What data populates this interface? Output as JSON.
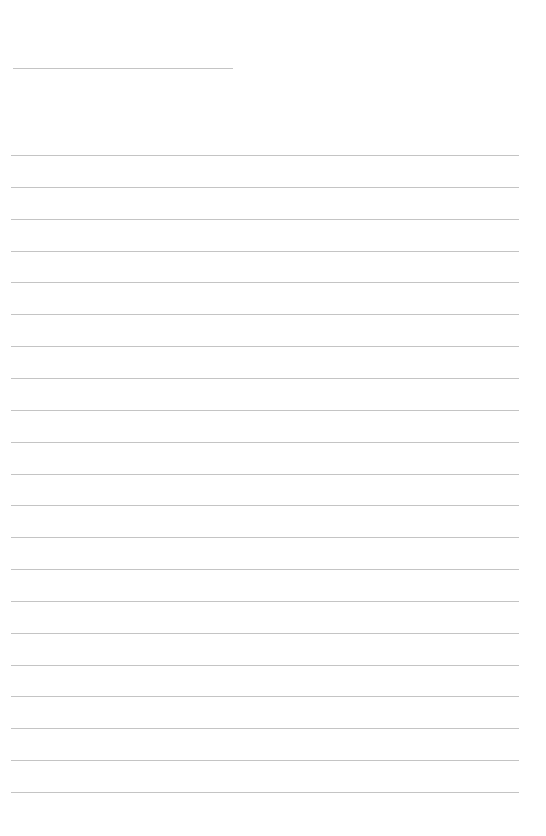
{
  "page": {
    "type": "ruled-paper",
    "line_color": "#c4c4c4",
    "title_line": {
      "left": 13,
      "top": 68,
      "width": 220
    },
    "lines": {
      "count": 21,
      "left": 11,
      "width": 508,
      "first_top": 155,
      "spacing": 31.85
    }
  }
}
